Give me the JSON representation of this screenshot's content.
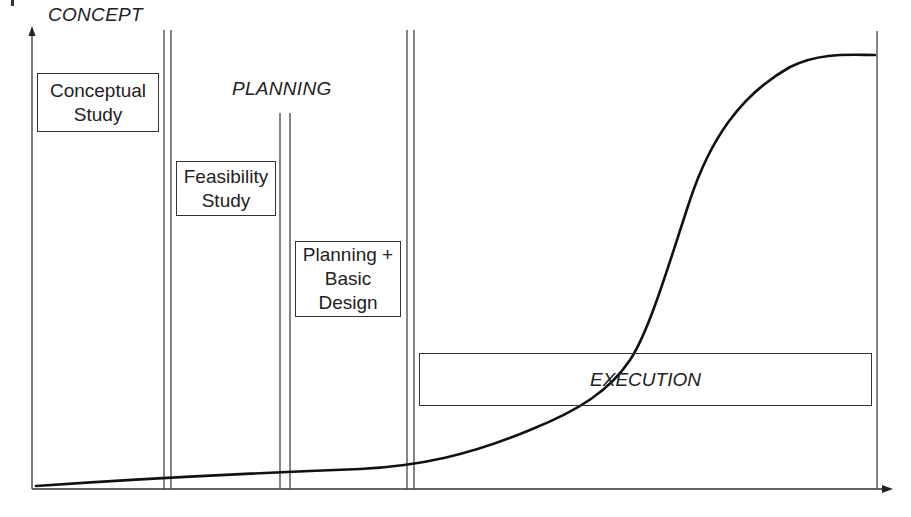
{
  "diagram": {
    "type": "project-lifecycle-s-curve",
    "phases": {
      "concept": "CONCEPT",
      "planning": "PLANNING"
    },
    "stages": [
      {
        "id": "conceptual-study",
        "label": "Conceptual\nStudy"
      },
      {
        "id": "feasibility-study",
        "label": "Feasibility\nStudy"
      },
      {
        "id": "planning-basic-design",
        "label": "Planning +\nBasic\nDesign"
      },
      {
        "id": "execution",
        "label": "EXECUTION"
      }
    ],
    "curve": {
      "description": "S-curve rising slowly through concept and planning, steeply during execution, leveling off near completion",
      "color": "#111111"
    },
    "axes": {
      "x_arrow": true,
      "y_arrow": true,
      "x_label": "",
      "y_label": ""
    },
    "line_color": "#333333"
  }
}
